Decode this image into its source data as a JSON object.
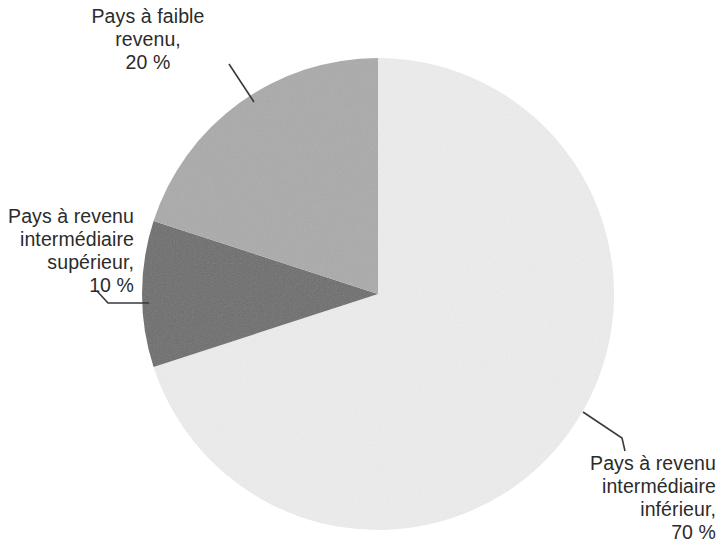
{
  "figure": {
    "type": "pie-chart",
    "background_color": "#ffffff",
    "text_color": "#2b2b2b",
    "leader_line_color": "#3a3a3a"
  },
  "labels": {
    "low_income": {
      "line1": "Pays à faible",
      "line2": "revenu,",
      "line3": "20 %"
    },
    "upper_middle_income": {
      "line1": "Pays à revenu",
      "line2": "intermédiaire",
      "line3": "supérieur,",
      "line4": "10 %"
    },
    "lower_middle_income": {
      "line1": "Pays à revenu",
      "line2": "intermédiaire",
      "line3": "inférieur,",
      "line4": "70 %"
    }
  },
  "chart_data": {
    "type": "pie",
    "title": "",
    "subtitle": "",
    "xlabel": "",
    "ylabel": "",
    "grid": false,
    "legend_position": "none",
    "label_format": "{name}, {value} %",
    "start_angle_deg": 0,
    "direction": "clockwise",
    "center": {
      "x": 378,
      "y": 294
    },
    "radius": 236,
    "categories": [
      "Pays à revenu intermédiaire inférieur",
      "Pays à revenu intermédiaire supérieur",
      "Pays à faible revenu"
    ],
    "values": [
      70,
      10,
      20
    ],
    "units": "%",
    "slices": [
      {
        "name": "Pays à revenu intermédiaire inférieur",
        "value": 70,
        "display_value": "70 %",
        "color": "#ededed",
        "start_angle_deg": 0,
        "end_angle_deg": 252
      },
      {
        "name": "Pays à revenu intermédiaire supérieur",
        "value": 10,
        "display_value": "10 %",
        "color": "#6c6c6c",
        "start_angle_deg": 252,
        "end_angle_deg": 288
      },
      {
        "name": "Pays à faible revenu",
        "value": 20,
        "display_value": "20 %",
        "color": "#aaaaaa",
        "start_angle_deg": 288,
        "end_angle_deg": 360
      }
    ]
  }
}
